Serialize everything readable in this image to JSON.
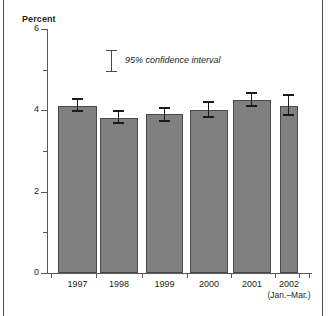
{
  "chart_data": {
    "type": "bar",
    "title": "",
    "ylabel": "Percent",
    "xlabel": "",
    "ylim": [
      0,
      6
    ],
    "yticks": [
      0,
      1,
      2,
      3,
      4,
      5,
      6
    ],
    "ytick_labels": [
      "0",
      "",
      "2",
      "",
      "4",
      "",
      "6"
    ],
    "grid": false,
    "legend_position": "inside-top-center",
    "legend_entries": [
      "95% confidence interval"
    ],
    "categories": [
      "1997",
      "1998",
      "1999",
      "2000",
      "2001",
      "2002"
    ],
    "category_sublabels": [
      "",
      "",
      "",
      "",
      "",
      "(Jan.–Mar.)"
    ],
    "values": [
      4.1,
      3.8,
      3.9,
      4.0,
      4.25,
      4.1
    ],
    "error_low": [
      3.95,
      3.65,
      3.72,
      3.8,
      4.08,
      3.85
    ],
    "error_high": [
      4.3,
      4.0,
      4.08,
      4.22,
      4.45,
      4.4
    ],
    "bar_color": "#808080",
    "bar_edge_color": "#4a4a4a",
    "error_bar_color": "#1a1a1a",
    "axis_color": "#595959"
  },
  "axis": {
    "y_title": "Percent"
  },
  "legend": {
    "label": "95% confidence interval"
  },
  "ticks": {
    "y": [
      {
        "value": 6,
        "label": "6",
        "major": true
      },
      {
        "value": 5,
        "label": "",
        "major": false
      },
      {
        "value": 4,
        "label": "4",
        "major": true
      },
      {
        "value": 3,
        "label": "",
        "major": false
      },
      {
        "value": 2,
        "label": "2",
        "major": true
      },
      {
        "value": 1,
        "label": "",
        "major": false
      },
      {
        "value": 0,
        "label": "0",
        "major": true
      }
    ]
  },
  "xlabels": [
    {
      "year": "1997",
      "sub": ""
    },
    {
      "year": "1998",
      "sub": ""
    },
    {
      "year": "1999",
      "sub": ""
    },
    {
      "year": "2000",
      "sub": ""
    },
    {
      "year": "2001",
      "sub": ""
    },
    {
      "year": "2002",
      "sub": "(Jan.–Mar.)"
    }
  ]
}
